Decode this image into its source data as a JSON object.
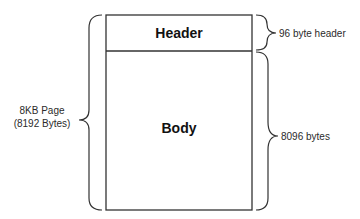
{
  "diagram": {
    "page": {
      "sections": [
        {
          "name": "Header",
          "size_bytes": 96
        },
        {
          "name": "Body",
          "size_bytes": 8096
        }
      ]
    },
    "annotations": {
      "page_line1": "8KB Page",
      "page_line2": "(8192 Bytes)",
      "header_size": "96 byte header",
      "body_size": "8096 bytes"
    },
    "colors": {
      "stroke": "#333333",
      "text": "#2b2b2b",
      "background": "#ffffff"
    }
  }
}
